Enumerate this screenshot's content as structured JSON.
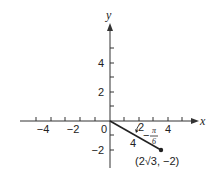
{
  "diagram": {
    "type": "cartesian-plane-with-vector",
    "axes": {
      "x_label": "x",
      "y_label": "y",
      "x_tick_labels": [
        "−4",
        "−2",
        "2",
        "4"
      ],
      "y_tick_labels": [
        "4",
        "2",
        "−2"
      ],
      "origin_label": "0"
    },
    "segment": {
      "from": [
        0,
        0
      ],
      "to_label": "(2√3, −2)",
      "length_label": "4",
      "angle_label_tick": "2",
      "angle_numerator": "π",
      "angle_denominator": "6",
      "angle_sign": "−"
    },
    "colors": {
      "axis": "#333333",
      "segment": "#222222",
      "text": "#222222"
    }
  }
}
